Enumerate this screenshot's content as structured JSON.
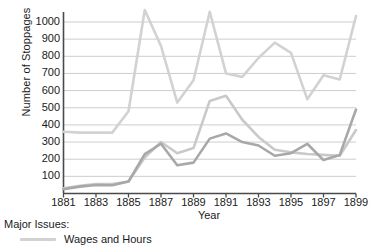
{
  "chart_data": {
    "type": "line",
    "title": "",
    "xlabel": "Year",
    "ylabel": "Number of Stoppages",
    "xlim": [
      1881,
      1899
    ],
    "ylim": [
      0,
      1060
    ],
    "grid": true,
    "legend_position": "below",
    "legend_title": "Major Issues:",
    "x": [
      1881,
      1882,
      1883,
      1884,
      1885,
      1886,
      1887,
      1888,
      1889,
      1890,
      1891,
      1892,
      1893,
      1894,
      1895,
      1896,
      1897,
      1898,
      1899
    ],
    "xticks": [
      "1881",
      "1883",
      "1885",
      "1887",
      "1889",
      "1891",
      "1893",
      "1895",
      "1897",
      "1899"
    ],
    "yticks": [
      "100",
      "200",
      "300",
      "400",
      "500",
      "600",
      "700",
      "800",
      "900",
      "1000"
    ],
    "series": [
      {
        "name": "Wages and Hours",
        "color": "#d2d2d2",
        "values": [
          360,
          355,
          355,
          355,
          480,
          1070,
          860,
          530,
          660,
          1060,
          700,
          680,
          790,
          880,
          820,
          550,
          690,
          665,
          1035
        ]
      },
      {
        "name": "Series 2",
        "color": "#c9c9c9",
        "values": [
          30,
          45,
          55,
          55,
          70,
          210,
          300,
          235,
          265,
          540,
          570,
          430,
          330,
          255,
          240,
          230,
          225,
          220,
          370
        ]
      },
      {
        "name": "Series 3",
        "color": "#a8a8a8",
        "values": [
          25,
          40,
          50,
          48,
          70,
          230,
          290,
          165,
          180,
          320,
          350,
          300,
          280,
          220,
          235,
          290,
          195,
          225,
          490
        ]
      }
    ]
  },
  "axes": {
    "ylabel": "Number of Stoppages",
    "xlabel": "Year",
    "ytick_labels": [
      "1000",
      "900",
      "800",
      "700",
      "600",
      "500",
      "400",
      "300",
      "200",
      "100"
    ],
    "xtick_labels": [
      "1881",
      "1883",
      "1885",
      "1887",
      "1889",
      "1891",
      "1893",
      "1895",
      "1897",
      "1899"
    ]
  },
  "legend": {
    "title": "Major Issues:",
    "items": [
      {
        "label": "Wages and Hours",
        "color": "#d2d2d2"
      }
    ]
  },
  "colors": {
    "axis": "#4a4a4a",
    "grid": "#c0c0c0",
    "text": "#1a1a1a",
    "series_light": "#d2d2d2",
    "series_mid": "#c9c9c9",
    "series_dark": "#a8a8a8",
    "background": "#ffffff"
  }
}
